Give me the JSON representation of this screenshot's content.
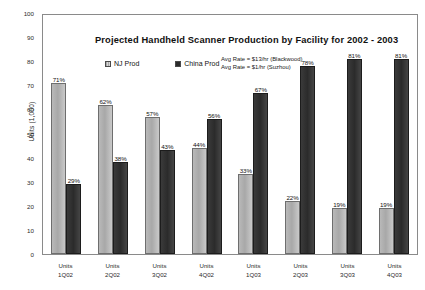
{
  "chart_data": {
    "type": "bar",
    "title": "Projected Handheld Scanner Production by Facility for 2002 - 2003",
    "xlabel": "",
    "ylabel": "Units (1,000)",
    "ylim": [
      0,
      100
    ],
    "ytick_step": 10,
    "yticks": [
      "0",
      "10",
      "20",
      "30",
      "40",
      "50",
      "60",
      "70",
      "80",
      "90",
      "100"
    ],
    "grid": false,
    "legend_position": "inside-top-left",
    "categories": [
      "Units\n1Q02",
      "Units\n2Q02",
      "Units\n3Q02",
      "Units\n4Q02",
      "Units\n1Q03",
      "Units\n2Q03",
      "Units\n3Q03",
      "Units\n4Q03"
    ],
    "category_lines": [
      {
        "top": "Units",
        "bottom": "1Q02"
      },
      {
        "top": "Units",
        "bottom": "2Q02"
      },
      {
        "top": "Units",
        "bottom": "3Q02"
      },
      {
        "top": "Units",
        "bottom": "4Q02"
      },
      {
        "top": "Units",
        "bottom": "1Q03"
      },
      {
        "top": "Units",
        "bottom": "2Q03"
      },
      {
        "top": "Units",
        "bottom": "3Q03"
      },
      {
        "top": "Units",
        "bottom": "4Q03"
      }
    ],
    "series": [
      {
        "name": "NJ Prod",
        "color": "#b4b4b4",
        "values": [
          71,
          62,
          57,
          44,
          33,
          22,
          19,
          19
        ],
        "labels": [
          "71%",
          "62%",
          "57%",
          "44%",
          "33%",
          "22%",
          "19%",
          "19%"
        ]
      },
      {
        "name": "China Prod",
        "color": "#2b2b2b",
        "values": [
          29,
          38,
          43,
          56,
          67,
          78,
          81,
          81
        ],
        "labels": [
          "29%",
          "38%",
          "43%",
          "56%",
          "67%",
          "78%",
          "81%",
          "81%"
        ]
      }
    ],
    "annotations": [
      "Avg Rate = $13/hr (Blackwood)",
      "Avg Rate = $1/hr (Suzhou)"
    ]
  }
}
